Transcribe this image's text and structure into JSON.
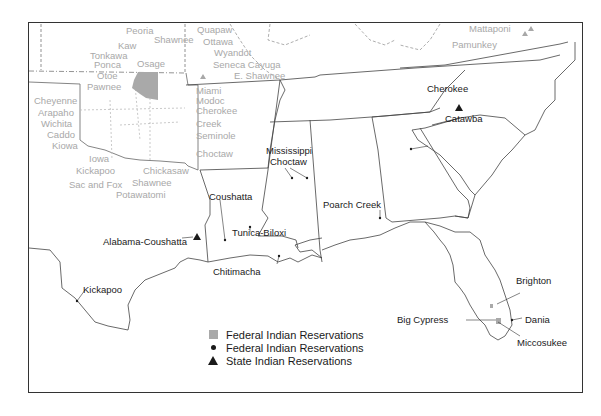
{
  "map": {
    "title": "",
    "colors": {
      "federal_area": "#a9a9a9",
      "federal_point": "#1a1a1a",
      "state_point": "#1a1a1a",
      "faded_label": "#a8a8a8",
      "label": "#1a1a1a",
      "border": "#333333"
    },
    "oklahoma_labels": {
      "peoria": "Peoria",
      "shawnee_n": "Shawnee",
      "kaw": "Kaw",
      "tonkawa": "Tonkawa",
      "ponca": "Ponca",
      "osage": "Osage",
      "otoe": "Otoe",
      "pawnee": "Pawnee",
      "cheyenne": "Cheyenne",
      "arapaho": "Arapaho",
      "wichita": "Wichita",
      "caddo": "Caddo",
      "kiowa": "Kiowa",
      "iowa": "Iowa",
      "kickapoo_ok": "Kickapoo",
      "sac_and_fox": "Sac and Fox",
      "chickasaw": "Chickasaw",
      "shawnee_s": "Shawnee",
      "potawatomi": "Potawatomi",
      "quapaw": "Quapaw",
      "ottawa": "Ottawa",
      "wyandot": "Wyandot",
      "seneca_cayuga": "Seneca Cayuga",
      "e_shawnee": "E. Shawnee",
      "miami": "Miami",
      "modoc": "Modoc",
      "cherokee_ok": "Cherokee",
      "creek": "Creek",
      "seminole": "Seminole",
      "choctaw_ok": "Choctaw"
    },
    "virginia_labels": {
      "mattaponi": "Mattaponi",
      "pamunkey": "Pamunkey"
    },
    "reservation_labels": {
      "cherokee_nc": "Cherokee",
      "catawba": "Catawba",
      "mississippi_choctaw_1": "Mississippi",
      "mississippi_choctaw_2": "Choctaw",
      "coushatta": "Coushatta",
      "alabama_coushatta": "Alabama-Coushatta",
      "tunica_biloxi": "Tunica-Biloxi",
      "chitimacha": "Chitimacha",
      "poarch_creek": "Poarch Creek",
      "kickapoo_tx": "Kickapoo",
      "brighton": "Brighton",
      "big_cypress": "Big Cypress",
      "dania": "Dania",
      "miccosukee": "Miccosukee"
    },
    "legend": [
      {
        "symbol": "square",
        "label": "Federal Indian Reservations"
      },
      {
        "symbol": "dot",
        "label": "Federal Indian Reservations"
      },
      {
        "symbol": "triangle",
        "label": "State Indian Reservations"
      }
    ]
  }
}
